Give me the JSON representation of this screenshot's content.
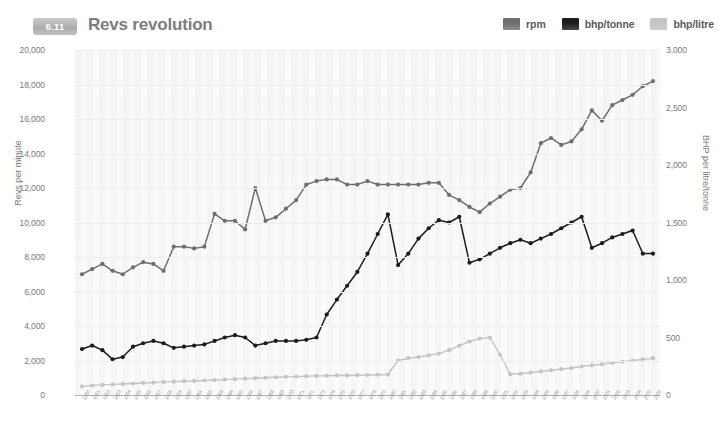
{
  "header": {
    "badge": "6.11",
    "title": "Revs revolution"
  },
  "legend": {
    "position": "top-right",
    "items": [
      {
        "label": "rpm",
        "color": "#6e6e6e"
      },
      {
        "label": "bhp/tonne",
        "color": "#1c1c1c"
      },
      {
        "label": "bhp/litre",
        "color": "#c4c4c4"
      }
    ]
  },
  "chart_data": {
    "type": "line",
    "title": "Revs revolution",
    "xlabel": "",
    "ylabel": "Revs per minute",
    "y2label": "BHP per litre/tonne",
    "ylim": [
      0,
      20000
    ],
    "y2lim": [
      0,
      3000
    ],
    "grid": true,
    "legend_position": "top-right",
    "y_ticks": [
      "0",
      "2,000",
      "4,000",
      "6,000",
      "8,000",
      "10,000",
      "12,000",
      "14,000",
      "16,000",
      "18,000",
      "20,000"
    ],
    "y_tick_values": [
      0,
      2000,
      4000,
      6000,
      8000,
      10000,
      12000,
      14000,
      16000,
      18000,
      20000
    ],
    "y2_ticks": [
      "0",
      "500",
      "1,000",
      "1,500",
      "2,000",
      "2,500",
      "3,000"
    ],
    "y2_tick_values": [
      0,
      500,
      1000,
      1500,
      2000,
      2500,
      3000
    ],
    "categories": [
      "1950",
      "1951",
      "1952",
      "1953",
      "1954",
      "1955",
      "1956",
      "1957",
      "1958",
      "1959",
      "1960",
      "1961",
      "1962",
      "1963",
      "1964",
      "1965",
      "1966",
      "1967",
      "1968",
      "1969",
      "1970",
      "1971",
      "1972",
      "1973",
      "1974",
      "1975",
      "1976",
      "1977",
      "1978",
      "1979",
      "1980",
      "1981",
      "1982",
      "1983",
      "1984",
      "1985",
      "1986",
      "1987",
      "1988",
      "1989",
      "1990",
      "1991",
      "1992",
      "1993",
      "1994",
      "1995",
      "1996",
      "1997",
      "1998",
      "1999",
      "2000",
      "2001",
      "2002",
      "2003",
      "2004",
      "2005",
      "2006"
    ],
    "series": [
      {
        "name": "rpm",
        "axis": "left",
        "color": "#6e6e6e",
        "values": [
          7000,
          7300,
          7600,
          7200,
          7000,
          7400,
          7700,
          7600,
          7200,
          8600,
          8600,
          8500,
          8600,
          10500,
          10100,
          10100,
          9600,
          12000,
          10100,
          10300,
          10800,
          11300,
          12200,
          12400,
          12500,
          12500,
          12200,
          12200,
          12400,
          12200,
          12200,
          12200,
          12200,
          12200,
          12300,
          12300,
          11600,
          11300,
          10900,
          10600,
          11100,
          11500,
          11900,
          12000,
          12900,
          14600,
          14900,
          14500,
          14700,
          15400,
          16500,
          15900,
          16800,
          17100,
          17400,
          17900,
          18200
        ]
      },
      {
        "name": "bhp/tonne",
        "axis": "right",
        "color": "#1c1c1c",
        "values": [
          400,
          430,
          390,
          310,
          330,
          420,
          450,
          470,
          450,
          410,
          420,
          430,
          440,
          470,
          500,
          520,
          500,
          430,
          450,
          470,
          470,
          470,
          480,
          500,
          700,
          830,
          950,
          1070,
          1230,
          1400,
          1570,
          1130,
          1230,
          1360,
          1450,
          1520,
          1500,
          1550,
          1150,
          1180,
          1230,
          1280,
          1320,
          1350,
          1320,
          1360,
          1400,
          1450,
          1500,
          1550,
          1280,
          1320,
          1370,
          1400,
          1430,
          1230,
          1230
        ]
      },
      {
        "name": "bhp/litre",
        "axis": "right",
        "color": "#c4c4c4",
        "values": [
          75,
          82,
          88,
          92,
          96,
          100,
          105,
          108,
          112,
          116,
          120,
          122,
          126,
          130,
          134,
          138,
          142,
          146,
          150,
          154,
          158,
          160,
          163,
          166,
          168,
          170,
          170,
          172,
          174,
          176,
          178,
          300,
          320,
          330,
          345,
          360,
          390,
          430,
          465,
          490,
          500,
          350,
          180,
          185,
          195,
          205,
          215,
          225,
          235,
          248,
          258,
          268,
          280,
          290,
          300,
          310,
          320
        ]
      }
    ]
  }
}
